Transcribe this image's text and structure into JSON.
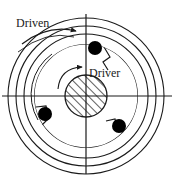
{
  "figure": {
    "background_color": "#ffffff",
    "line_color": "#1a1a1a",
    "roller_color": "#000000",
    "width": 174,
    "height": 180
  },
  "labels": {
    "driven": "Driven",
    "driver": "Driver"
  },
  "icons": {
    "driven_arrow": "curved-arrow-clockwise",
    "driver_arrow": "curved-arrow-clockwise"
  },
  "geometry": {
    "center_x": 86,
    "center_y": 96,
    "outer_ring_radius": 78,
    "middle_ring_radius": 70,
    "driven_ring_radius": 62,
    "cam_ring_radius": 52,
    "hub_radius": 21,
    "roller_radius": 7,
    "rollers": [
      {
        "name": "roller-top",
        "x": 95,
        "y": 48
      },
      {
        "name": "roller-lower-left",
        "x": 45,
        "y": 114
      },
      {
        "name": "roller-lower-right",
        "x": 119,
        "y": 126
      }
    ],
    "axes": {
      "horizontal_y": 96,
      "horizontal_x1": 2,
      "horizontal_x2": 172,
      "vertical_x": 86,
      "vertical_y1": 14,
      "vertical_y2": 174
    }
  }
}
